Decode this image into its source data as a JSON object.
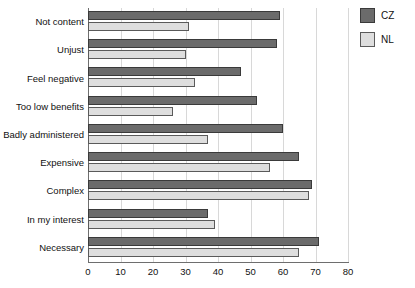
{
  "chart_data": {
    "type": "bar",
    "orientation": "horizontal",
    "title": "",
    "xlabel": "",
    "ylabel": "",
    "xlim": [
      0,
      80
    ],
    "xticks": [
      0,
      10,
      20,
      30,
      40,
      50,
      60,
      70,
      80
    ],
    "grid": true,
    "legend_position": "right",
    "categories": [
      "Not content",
      "Unjust",
      "Feel negative",
      "Too low benefits",
      "Badly administered",
      "Expensive",
      "Complex",
      "In my interest",
      "Necessary"
    ],
    "series": [
      {
        "name": "CZ",
        "color": "#6b6b6b",
        "values": [
          59,
          58,
          47,
          52,
          60,
          65,
          69,
          37,
          71
        ]
      },
      {
        "name": "NL",
        "color": "#dedede",
        "values": [
          31,
          30,
          33,
          26,
          37,
          56,
          68,
          39,
          65
        ]
      }
    ]
  },
  "legend": {
    "items": [
      {
        "label": "CZ",
        "swatch": "cz"
      },
      {
        "label": "NL",
        "swatch": "nl"
      }
    ]
  }
}
